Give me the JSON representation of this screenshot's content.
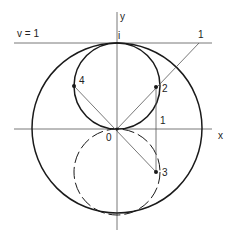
{
  "diagram": {
    "colors": {
      "stroke": "#1a1a1a",
      "thin": "#555555",
      "background": "#ffffff"
    },
    "labels": {
      "y_axis": "y",
      "x_axis": "x",
      "line_label": "v = 1",
      "i_label": "i",
      "origin": "0",
      "point_1_top": "1",
      "point_1_axis": "1",
      "point_2": "2",
      "point_3": "3",
      "point_4": "4"
    }
  }
}
